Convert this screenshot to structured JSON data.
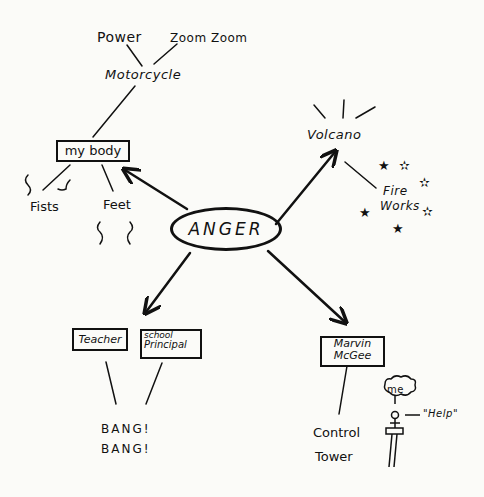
{
  "diagram": {
    "type": "mind-map",
    "center": {
      "label": "ANGER"
    },
    "branches": [
      {
        "label": "my body",
        "boxed": true,
        "children": [
          {
            "label": "Motorcycle",
            "children": [
              {
                "label": "Power"
              },
              {
                "label": "Zoom Zoom"
              }
            ]
          },
          {
            "label": "Fists"
          },
          {
            "label": "Feet"
          }
        ]
      },
      {
        "label": "Volcano",
        "boxed": false,
        "children": [
          {
            "label": "Fire Works",
            "lines": [
              "Fire",
              "Works"
            ]
          }
        ]
      },
      {
        "label": "Teacher / School Principal",
        "boxes": [
          {
            "label": "Teacher"
          },
          {
            "label": "School Principal",
            "lines": [
              "school",
              "Principal"
            ]
          }
        ],
        "children": [
          {
            "label": "BANG! BANG!",
            "lines": [
              "BANG!",
              "BANG!"
            ]
          }
        ]
      },
      {
        "label": "Marvin McGee",
        "boxed": true,
        "lines": [
          "Marvin",
          "McGee"
        ],
        "children": [
          {
            "label": "Control Tower",
            "lines": [
              "Control",
              "Tower"
            ]
          }
        ],
        "figure": {
          "thought": "me",
          "speech": "\"Help\""
        }
      }
    ]
  }
}
